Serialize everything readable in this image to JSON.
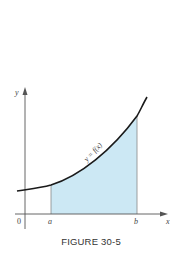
{
  "figure": {
    "caption": "FIGURE 30-5",
    "curve_label": "y = f(x)",
    "axes": {
      "x_label": "x",
      "y_label": "y",
      "origin_label": "0"
    },
    "bounds": {
      "a_label": "a",
      "b_label": "b"
    },
    "colors": {
      "shade": "#cce8f4",
      "curve": "#1a1a1a",
      "axis": "#555555",
      "bound_lines": "#888888"
    }
  }
}
